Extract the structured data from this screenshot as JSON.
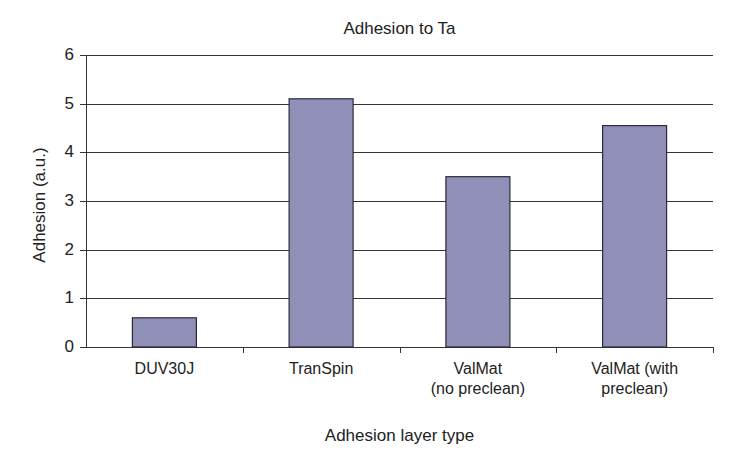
{
  "chart_data": {
    "type": "bar",
    "title": "Adhesion to Ta",
    "xlabel": "Adhesion layer type",
    "ylabel": "Adhesion (a.u.)",
    "categories": [
      "DUV30J",
      "TranSpin",
      "ValMat\n(no preclean)",
      "ValMat (with\npreclean)"
    ],
    "values": [
      0.6,
      5.1,
      3.5,
      4.55
    ],
    "ylim": [
      0,
      6
    ],
    "yticks": [
      0,
      1,
      2,
      3,
      4,
      5,
      6
    ],
    "grid": true,
    "legend": null,
    "bar_color": "#8f8fb8",
    "bar_edge_color": "#2a2a3a",
    "grid_color": "#333333"
  },
  "layout": {
    "plot_left": 86,
    "plot_right": 713,
    "plot_top": 55,
    "plot_bottom": 347,
    "bar_width": 64
  }
}
